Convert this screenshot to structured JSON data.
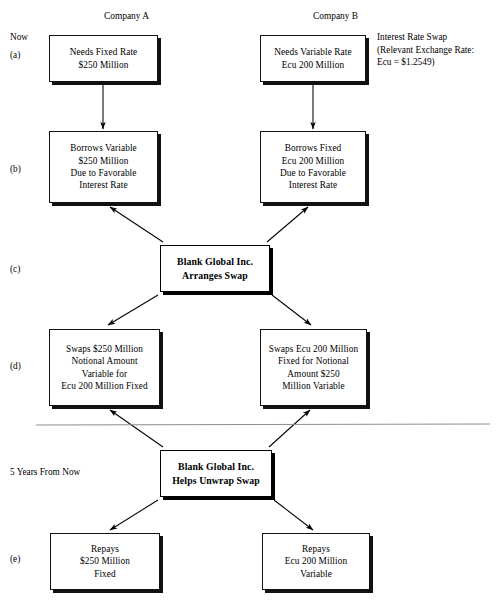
{
  "diagram": {
    "column_headers": [
      {
        "name": "company-a",
        "label": "Company A",
        "x": 104,
        "y": 10
      },
      {
        "name": "company-b",
        "label": "Company B",
        "x": 313,
        "y": 10
      }
    ],
    "stage_labels": [
      {
        "name": "now",
        "label": "Now",
        "x": 10,
        "y": 31
      },
      {
        "name": "step-a",
        "label": "(a)",
        "x": 10,
        "y": 49
      },
      {
        "name": "step-b",
        "label": "(b)",
        "x": 10,
        "y": 163
      },
      {
        "name": "step-c",
        "label": "(c)",
        "x": 10,
        "y": 263
      },
      {
        "name": "step-d",
        "label": "(d)",
        "x": 10,
        "y": 360
      },
      {
        "name": "five-years-from-now",
        "label": "5 Years From Now",
        "x": 10,
        "y": 466
      },
      {
        "name": "step-e",
        "label": "(e)",
        "x": 10,
        "y": 553
      }
    ],
    "side_note": {
      "name": "interest-rate-swap-note",
      "x": 377,
      "y": 31,
      "lines": [
        "Interest Rate Swap",
        "(Relevant Exchange Rate:",
        "Ecu  =  $1.2549)"
      ]
    },
    "boxes": [
      {
        "name": "box-a-company-a-needs",
        "x": 49,
        "y": 35,
        "w": 109,
        "h": 47,
        "bold": false,
        "lines": [
          "Needs Fixed Rate",
          "$250 Million"
        ]
      },
      {
        "name": "box-a-company-b-needs",
        "x": 260,
        "y": 35,
        "w": 106,
        "h": 47,
        "bold": false,
        "lines": [
          "Needs Variable Rate",
          "Ecu 200 Million"
        ]
      },
      {
        "name": "box-b-company-a-borrows",
        "x": 49,
        "y": 131,
        "w": 109,
        "h": 72,
        "bold": false,
        "lines": [
          "Borrows Variable",
          "$250 Million",
          "Due to Favorable",
          "Interest Rate"
        ]
      },
      {
        "name": "box-b-company-b-borrows",
        "x": 260,
        "y": 131,
        "w": 106,
        "h": 72,
        "bold": false,
        "lines": [
          "Borrows Fixed",
          "Ecu 200 Million",
          "Due to Favorable",
          "Interest Rate"
        ]
      },
      {
        "name": "box-c-broker-arranges-swap",
        "x": 160,
        "y": 245,
        "w": 110,
        "h": 47,
        "bold": true,
        "lines": [
          "Blank Global Inc.",
          "Arranges Swap"
        ]
      },
      {
        "name": "box-d-company-a-swaps",
        "x": 49,
        "y": 329,
        "w": 111,
        "h": 77,
        "bold": false,
        "lines": [
          "Swaps $250 Million",
          "Notional Amount",
          "Variable for",
          "Ecu 200 Million Fixed"
        ]
      },
      {
        "name": "box-d-company-b-swaps",
        "x": 260,
        "y": 329,
        "w": 107,
        "h": 77,
        "bold": false,
        "lines": [
          "Swaps Ecu 200 Million",
          "Fixed for Notional",
          "Amount $250",
          "Million Variable"
        ]
      },
      {
        "name": "box-broker-helps-unwrap-swap",
        "x": 160,
        "y": 450,
        "w": 112,
        "h": 47,
        "bold": true,
        "lines": [
          "Blank Global Inc.",
          "Helps Unwrap Swap"
        ]
      },
      {
        "name": "box-e-company-a-repays",
        "x": 50,
        "y": 533,
        "w": 110,
        "h": 57,
        "bold": false,
        "lines": [
          "Repays",
          "$250 Million",
          "Fixed"
        ]
      },
      {
        "name": "box-e-company-b-repays",
        "x": 262,
        "y": 533,
        "w": 108,
        "h": 57,
        "bold": false,
        "lines": [
          "Repays",
          "Ecu 200 Million",
          "Variable"
        ]
      }
    ],
    "divider": {
      "name": "time-divider-line",
      "x1": 36,
      "y1": 425,
      "x2": 490,
      "y2": 424,
      "color": "#8d8d8d"
    },
    "connectors": [
      {
        "name": "arrow-a-to-b-left",
        "x1": 103,
        "y1": 84,
        "x2": 103,
        "y2": 129
      },
      {
        "name": "arrow-a-to-b-right",
        "x1": 313,
        "y1": 84,
        "x2": 313,
        "y2": 129
      },
      {
        "name": "arrow-c-to-b-left",
        "x1": 163,
        "y1": 242,
        "x2": 110,
        "y2": 207
      },
      {
        "name": "arrow-c-to-b-right",
        "x1": 267,
        "y1": 242,
        "x2": 308,
        "y2": 207
      },
      {
        "name": "arrow-c-to-d-left",
        "x1": 158,
        "y1": 295,
        "x2": 108,
        "y2": 325
      },
      {
        "name": "arrow-c-to-d-right",
        "x1": 272,
        "y1": 295,
        "x2": 311,
        "y2": 325
      },
      {
        "name": "arrow-unwrap-from-d-left",
        "x1": 163,
        "y1": 447,
        "x2": 110,
        "y2": 410
      },
      {
        "name": "arrow-unwrap-from-d-right",
        "x1": 269,
        "y1": 447,
        "x2": 310,
        "y2": 410
      },
      {
        "name": "arrow-unwrap-to-e-left",
        "x1": 158,
        "y1": 500,
        "x2": 110,
        "y2": 530
      },
      {
        "name": "arrow-unwrap-to-e-right",
        "x1": 274,
        "y1": 500,
        "x2": 313,
        "y2": 530
      }
    ],
    "colors": {
      "ink": "#000000",
      "divider": "#8d8d8d",
      "box_fill": "#ffffff"
    }
  }
}
